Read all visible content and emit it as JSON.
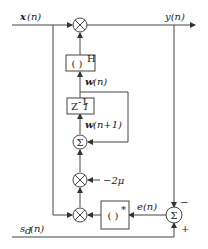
{
  "diagram": {
    "type": "block-diagram",
    "title": "",
    "signals": {
      "input": "x(n)",
      "output": "y(n)",
      "desired": "s_d(n)",
      "error": "e(n)",
      "weight": "w(n)",
      "weight_next": "w(n+1)",
      "step": "-2μ"
    },
    "blocks": {
      "hermitian": {
        "base": "( )",
        "sup": "H"
      },
      "delay": {
        "base": "Z",
        "sup": "-1",
        "tail": "I"
      },
      "conjugate": {
        "base": "( )",
        "sup": "*"
      }
    },
    "nodes": {
      "sum_symbol": "Σ",
      "minus": "−",
      "plus": "+"
    },
    "labels": {
      "x_bold": "x",
      "x_arg": "(n)",
      "y": "y(n)",
      "sd_s": "s",
      "sd_sub": "d",
      "sd_arg": "(n)",
      "w_bold": "w",
      "w_arg": "(n)",
      "w1_bold": "w",
      "w1_arg": "(n+1)",
      "e": "e(n)",
      "mu": "−2μ"
    }
  }
}
